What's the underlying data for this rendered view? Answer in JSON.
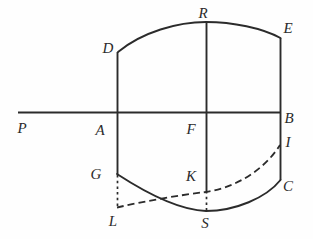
{
  "figure": {
    "background_color": "#fefefe",
    "ink_color": "#2b2b2b",
    "stroke_width": 1.6,
    "width": 313,
    "height": 239
  },
  "labels": [
    {
      "id": "R",
      "text": "R",
      "x": 203,
      "y": 13
    },
    {
      "id": "E",
      "text": "E",
      "x": 288,
      "y": 28
    },
    {
      "id": "D",
      "text": "D",
      "x": 108,
      "y": 48
    },
    {
      "id": "B",
      "text": "B",
      "x": 289,
      "y": 118
    },
    {
      "id": "P",
      "text": "P",
      "x": 22,
      "y": 128
    },
    {
      "id": "A",
      "text": "A",
      "x": 100,
      "y": 130
    },
    {
      "id": "F",
      "text": "F",
      "x": 191,
      "y": 129
    },
    {
      "id": "I",
      "text": "I",
      "x": 288,
      "y": 142
    },
    {
      "id": "G",
      "text": "G",
      "x": 96,
      "y": 174
    },
    {
      "id": "K",
      "text": "K",
      "x": 191,
      "y": 176
    },
    {
      "id": "C",
      "text": "C",
      "x": 288,
      "y": 186
    },
    {
      "id": "L",
      "text": "L",
      "x": 113,
      "y": 221
    },
    {
      "id": "S",
      "text": "S",
      "x": 205,
      "y": 223
    }
  ],
  "points": {
    "P": {
      "x": 18,
      "y": 112
    },
    "A": {
      "x": 117,
      "y": 112
    },
    "F": {
      "x": 206,
      "y": 112
    },
    "B": {
      "x": 280,
      "y": 112
    },
    "D": {
      "x": 118,
      "y": 52
    },
    "R": {
      "x": 206,
      "y": 22
    },
    "E": {
      "x": 280,
      "y": 38
    },
    "G": {
      "x": 117,
      "y": 174
    },
    "K": {
      "x": 206,
      "y": 192
    },
    "I": {
      "x": 280,
      "y": 145
    },
    "L": {
      "x": 117,
      "y": 207
    },
    "S": {
      "x": 206,
      "y": 211
    },
    "C": {
      "x": 280,
      "y": 180
    }
  },
  "strokes": [
    {
      "id": "baseline-PB",
      "kind": "line",
      "style": "solid",
      "from": "P",
      "to": "B"
    },
    {
      "id": "vertical-AD",
      "kind": "line",
      "style": "solid",
      "from": "D",
      "to": "A"
    },
    {
      "id": "vertical-FR",
      "kind": "line",
      "style": "solid",
      "from": "R",
      "to": "F"
    },
    {
      "id": "vertical-EB",
      "kind": "line",
      "style": "solid",
      "from": "E",
      "to": "B"
    },
    {
      "id": "vertical-AG",
      "kind": "line",
      "style": "solid",
      "from": "A",
      "to": "G"
    },
    {
      "id": "vertical-FS",
      "kind": "line",
      "style": "solid",
      "from": "F",
      "to": "K"
    },
    {
      "id": "vertical-BC",
      "kind": "line",
      "style": "solid",
      "from": "B",
      "to": "C"
    },
    {
      "id": "arc-D-R-E",
      "kind": "arc",
      "style": "solid",
      "from": "D",
      "through": "R",
      "to": "E"
    },
    {
      "id": "arc-G-S-C",
      "kind": "arc",
      "style": "solid",
      "from": "G",
      "through": "S",
      "to": "C"
    },
    {
      "id": "curve-L-K-I",
      "kind": "curve",
      "style": "dash-dot",
      "from": "L",
      "through": "K",
      "to": "I"
    },
    {
      "id": "dotted-G-L",
      "kind": "line",
      "style": "dotted",
      "from": "G",
      "to": "L"
    },
    {
      "id": "dotted-K-S",
      "kind": "line",
      "style": "dotted",
      "from": "K",
      "to": "S"
    }
  ]
}
